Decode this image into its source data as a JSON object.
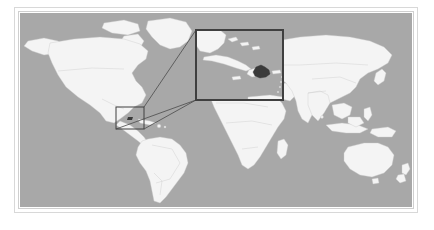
{
  "figure": {
    "type": "locator-map",
    "alt_text": "Grey world map showing the location of the Dominican Republic, with an enlarged inset of the Greater Antilles",
    "caption": ""
  },
  "colors": {
    "page_background": "#ffffff",
    "frame_outer": "#d8d8d8",
    "frame_inner": "#cfcfcf",
    "ocean": "#a8a8a8",
    "land": "#f4f4f4",
    "land_border": "#c9c9c9",
    "highlight_country": "#3a3a3a",
    "callout_line": "#4a4a4a",
    "locator_box": "#3f3f3f",
    "inset_box": "#3f3f3f",
    "inset_ocean": "#a8a8a8"
  },
  "map": {
    "projection": "equirectangular",
    "viewport": {
      "x": 20,
      "y": 13,
      "width": 392,
      "height": 194
    },
    "graticule": false,
    "labels": [],
    "regions": [
      "North America",
      "Greenland",
      "South America",
      "Europe",
      "Africa",
      "Asia",
      "Australia",
      "New Zealand",
      "Southeast Asia",
      "Japan",
      "Madagascar",
      "Iceland",
      "British Isles"
    ]
  },
  "locator": {
    "name": "caribbean-locator-box",
    "box": {
      "x": 116,
      "y": 107,
      "width": 28,
      "height": 22
    },
    "stroke_width": 1
  },
  "inset": {
    "name": "caribbean-inset",
    "box": {
      "x": 196,
      "y": 30,
      "width": 87,
      "height": 70
    },
    "stroke_width": 2,
    "title": "",
    "features": [
      "Cuba",
      "Jamaica",
      "Hispaniola",
      "Haiti",
      "Dominican Republic",
      "Puerto Rico",
      "Bahamas",
      "Florida"
    ]
  },
  "highlight": {
    "country": "Dominican Republic",
    "fill": "#3a3a3a",
    "shown_in": "inset"
  },
  "callout_lines": [
    {
      "from": "locator-box-top-right",
      "to": "inset-box-bottom-left"
    },
    {
      "from": "locator-box-bottom-right",
      "to": "inset-box-bottom-left"
    }
  ]
}
